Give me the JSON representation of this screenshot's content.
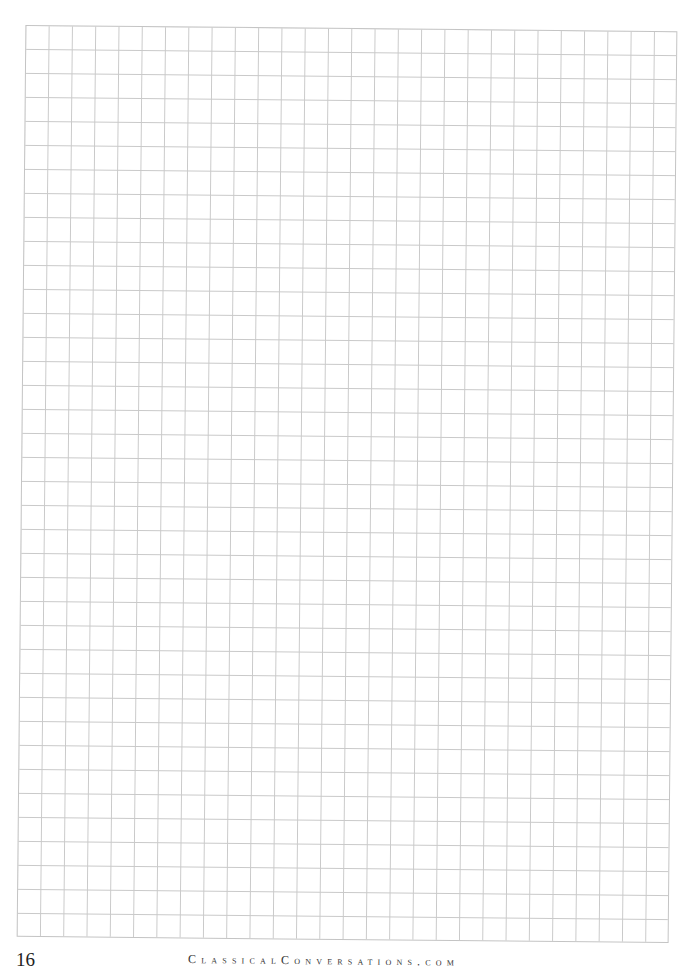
{
  "page": {
    "type": "graph-paper",
    "grid": {
      "columns": 28,
      "rows": 38,
      "line_color": "#c9c9c9"
    },
    "page_number": "16",
    "footer_brand": "ClassicalConversations.com"
  }
}
